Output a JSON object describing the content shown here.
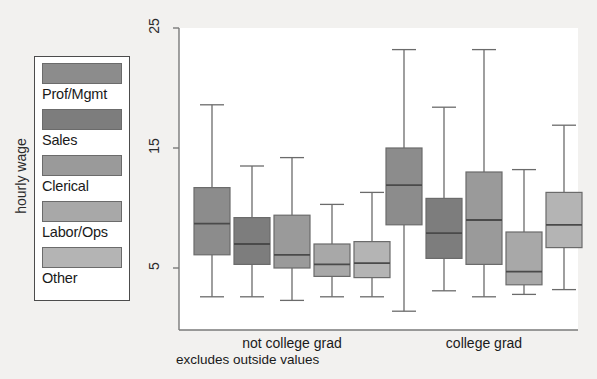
{
  "figure": {
    "background_color": "#f2f1ef",
    "plot_background_color": "#ffffff",
    "axis_color": "#7a7a7a"
  },
  "legend": {
    "name": "occupation-legend",
    "items": [
      {
        "label": "Prof/Mgmt",
        "color": "#8c8c8c"
      },
      {
        "label": "Sales",
        "color": "#7d7d7d"
      },
      {
        "label": "Clerical",
        "color": "#9a9a9a"
      },
      {
        "label": "Labor/Ops",
        "color": "#a8a8a8"
      },
      {
        "label": "Other",
        "color": "#b4b4b4"
      }
    ]
  },
  "axes": {
    "ylabel": "hourly wage",
    "yticks": [
      5,
      15,
      25
    ],
    "ytick_labels": [
      "5",
      "15",
      "25"
    ],
    "ylim": [
      1.0,
      26.5
    ],
    "xtick_labels": [
      "not college grad",
      "college grad"
    ]
  },
  "footnote": "excludes outside values",
  "chart_data": {
    "type": "box",
    "title": "",
    "xlabel": "",
    "ylabel": "hourly wage",
    "ylim": [
      1.0,
      26.5
    ],
    "yticks": [
      5,
      15,
      25
    ],
    "grid": false,
    "legend_position": "left-outside",
    "note": "excludes outside values",
    "categories": [
      "not college grad",
      "college grad"
    ],
    "groups": [
      "Prof/Mgmt",
      "Sales",
      "Clerical",
      "Labor/Ops",
      "Other"
    ],
    "boxes": [
      {
        "category": "not college grad",
        "group": "Prof/Mgmt",
        "color": "#8c8c8c",
        "whisker_low": 2.6,
        "q1": 6.1,
        "median": 8.7,
        "q3": 11.7,
        "whisker_high": 18.6
      },
      {
        "category": "not college grad",
        "group": "Sales",
        "color": "#7d7d7d",
        "whisker_low": 2.6,
        "q1": 5.3,
        "median": 7.0,
        "q3": 9.2,
        "whisker_high": 13.5
      },
      {
        "category": "not college grad",
        "group": "Clerical",
        "color": "#9a9a9a",
        "whisker_low": 2.3,
        "q1": 5.0,
        "median": 6.1,
        "q3": 9.4,
        "whisker_high": 14.2
      },
      {
        "category": "not college grad",
        "group": "Labor/Ops",
        "color": "#a8a8a8",
        "whisker_low": 2.6,
        "q1": 4.3,
        "median": 5.3,
        "q3": 7.0,
        "whisker_high": 10.3
      },
      {
        "category": "not college grad",
        "group": "Other",
        "color": "#b4b4b4",
        "whisker_low": 2.6,
        "q1": 4.2,
        "median": 5.4,
        "q3": 7.2,
        "whisker_high": 11.3
      },
      {
        "category": "college grad",
        "group": "Prof/Mgmt",
        "color": "#8c8c8c",
        "whisker_low": 1.4,
        "q1": 8.6,
        "median": 11.9,
        "q3": 15.0,
        "whisker_high": 23.2
      },
      {
        "category": "college grad",
        "group": "Sales",
        "color": "#7d7d7d",
        "whisker_low": 3.1,
        "q1": 5.8,
        "median": 7.9,
        "q3": 10.8,
        "whisker_high": 18.4
      },
      {
        "category": "college grad",
        "group": "Clerical",
        "color": "#9a9a9a",
        "whisker_low": 2.6,
        "q1": 5.3,
        "median": 9.0,
        "q3": 13.0,
        "whisker_high": 23.2
      },
      {
        "category": "college grad",
        "group": "Labor/Ops",
        "color": "#a8a8a8",
        "whisker_low": 2.8,
        "q1": 3.6,
        "median": 4.7,
        "q3": 8.0,
        "whisker_high": 13.2
      },
      {
        "category": "college grad",
        "group": "Other",
        "color": "#b4b4b4",
        "whisker_low": 3.2,
        "q1": 6.7,
        "median": 8.6,
        "q3": 11.3,
        "whisker_high": 16.9
      }
    ]
  }
}
